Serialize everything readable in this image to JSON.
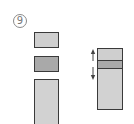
{
  "figure": {
    "label": "9"
  },
  "left_stack": {
    "blocks": [
      {
        "name": "top-block",
        "fill": "#cfcfcf",
        "x": 34,
        "y": 32,
        "w": 25,
        "h": 16
      },
      {
        "name": "middle-block",
        "fill": "#a9a9a9",
        "x": 34,
        "y": 56,
        "w": 25,
        "h": 16
      },
      {
        "name": "bottom-block",
        "fill": "#d2d2d2",
        "x": 34,
        "y": 79,
        "w": 25,
        "h": 46
      }
    ]
  },
  "right_stack": {
    "x": 97,
    "y": 48,
    "w": 26,
    "h": 62,
    "segments": [
      {
        "name": "top-segment",
        "fill": "#cfcfcf",
        "height": 12
      },
      {
        "name": "middle-segment",
        "fill": "#a9a9a9",
        "height": 8
      },
      {
        "name": "bottom-segment",
        "fill": "#d2d2d2",
        "height": 42
      }
    ],
    "arrow": {
      "type": "double-headed-vertical",
      "x": 93,
      "y_top": 50,
      "y_bottom": 78,
      "color": "#444444"
    }
  },
  "colors": {
    "outline": "#3a3a3a",
    "light_fill": "#cfcfcf",
    "dark_fill": "#a9a9a9",
    "label_text": "#777777"
  }
}
